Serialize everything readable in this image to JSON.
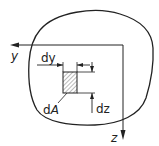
{
  "diagram": {
    "labels": {
      "y_axis": "y",
      "z_axis": "z",
      "dy": "dy",
      "dz": "dz",
      "dA_d": "d",
      "dA_A": "A"
    },
    "colors": {
      "stroke": "#222222",
      "background": "#ffffff",
      "hatch": "#555555"
    }
  }
}
